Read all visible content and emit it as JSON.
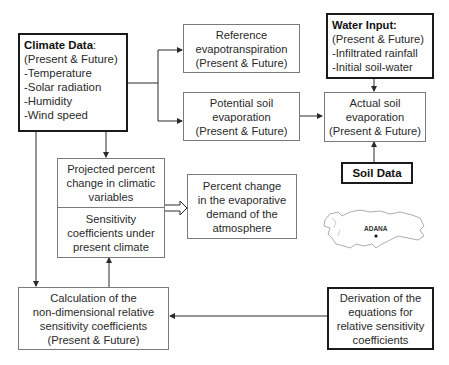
{
  "climate_data": {
    "title": "Climate Data",
    "title_suffix": ":",
    "lines": [
      "(Present & Future)",
      "-Temperature",
      "-Solar radiation",
      "-Humidity",
      "-Wind speed"
    ]
  },
  "reference_et": {
    "lines": [
      "Reference",
      "evapotranspiration",
      "(Present & Future)"
    ]
  },
  "potential_soil_evap": {
    "lines": [
      "Potential soil",
      "evaporation",
      "(Present & Future)"
    ]
  },
  "water_input": {
    "title": "Water Input:",
    "lines": [
      "(Present & Future)",
      "-Infiltrated rainfall",
      "-Initial soil-water"
    ]
  },
  "actual_soil_evap": {
    "lines": [
      "Actual soil",
      "evaporation",
      "(Present & Future)"
    ]
  },
  "soil_data": {
    "title": "Soil Data"
  },
  "projected_change": {
    "lines": [
      "Projected percent",
      "change in climatic",
      "variables"
    ]
  },
  "sensitivity_present": {
    "lines": [
      "Sensitivity",
      "coefficients under",
      "present climate"
    ]
  },
  "percent_change_demand": {
    "lines": [
      "Percent change",
      "in the evaporative",
      "demand of the",
      "atmosphere"
    ]
  },
  "calculation": {
    "lines": [
      "Calculation of the",
      "non-dimensional relative",
      "sensitivity coefficients",
      "(Present & Future)"
    ]
  },
  "derivation": {
    "lines": [
      "Derivation of  the",
      "equations for",
      "relative sensitivity",
      "coefficients"
    ]
  },
  "map": {
    "label": "ADANA",
    "region": "Turkey outline"
  }
}
